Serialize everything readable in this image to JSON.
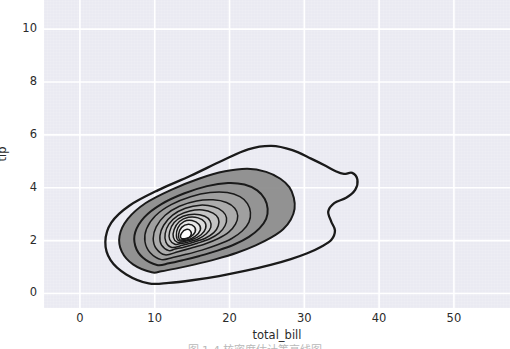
{
  "chart_data": {
    "type": "line",
    "subtype": "kde-contour",
    "title": "",
    "subtitle": "",
    "xlabel": "total_bill",
    "ylabel": "tip",
    "xlim": [
      -4.8,
      57.5
    ],
    "ylim": [
      -0.55,
      11.1
    ],
    "xticks": [
      0,
      10,
      20,
      30,
      40,
      50
    ],
    "yticks": [
      0,
      2,
      4,
      6,
      8,
      10
    ],
    "xtick_labels": [
      "0",
      "10",
      "20",
      "30",
      "40",
      "50"
    ],
    "ytick_labels": [
      "0",
      "2",
      "4",
      "6",
      "8",
      "10"
    ],
    "grid": true,
    "grid_color": "#ffffff",
    "plot_background": "#eaeaf2",
    "legend": null,
    "legend_position": "none",
    "line_color": "#1a1a1a",
    "fill_colormap": "gray-reversed",
    "n_levels": 12,
    "peak": {
      "total_bill": 13.5,
      "tip": 2.0
    },
    "contours": [
      {
        "level": 1,
        "level_label": "outermost",
        "points": [
          [
            9.2,
            0.38
          ],
          [
            6.2,
            0.72
          ],
          [
            4.1,
            1.26
          ],
          [
            3.4,
            1.95
          ],
          [
            4.2,
            2.68
          ],
          [
            6.6,
            3.32
          ],
          [
            10.4,
            3.9
          ],
          [
            14.8,
            4.45
          ],
          [
            19.0,
            5.02
          ],
          [
            22.5,
            5.45
          ],
          [
            25.6,
            5.58
          ],
          [
            28.4,
            5.42
          ],
          [
            30.9,
            5.1
          ],
          [
            32.9,
            4.82
          ],
          [
            34.2,
            4.62
          ],
          [
            35.3,
            4.52
          ],
          [
            36.4,
            4.56
          ],
          [
            37.1,
            4.3
          ],
          [
            36.8,
            3.92
          ],
          [
            35.6,
            3.62
          ],
          [
            34.0,
            3.42
          ],
          [
            33.2,
            3.1
          ],
          [
            33.6,
            2.72
          ],
          [
            34.1,
            2.38
          ],
          [
            33.6,
            2.02
          ],
          [
            32.2,
            1.76
          ],
          [
            30.4,
            1.52
          ],
          [
            28.2,
            1.3
          ],
          [
            25.5,
            1.08
          ],
          [
            22.2,
            0.86
          ],
          [
            18.6,
            0.66
          ],
          [
            15.0,
            0.5
          ],
          [
            11.9,
            0.4
          ],
          [
            9.2,
            0.38
          ]
        ]
      },
      {
        "level": 2,
        "points": [
          [
            9.6,
            0.8
          ],
          [
            7.1,
            1.1
          ],
          [
            5.6,
            1.58
          ],
          [
            5.3,
            2.18
          ],
          [
            6.4,
            2.82
          ],
          [
            8.8,
            3.42
          ],
          [
            12.2,
            3.92
          ],
          [
            15.9,
            4.34
          ],
          [
            19.4,
            4.62
          ],
          [
            22.4,
            4.72
          ],
          [
            24.9,
            4.6
          ],
          [
            26.8,
            4.34
          ],
          [
            28.0,
            4.02
          ],
          [
            28.6,
            3.62
          ],
          [
            28.7,
            3.2
          ],
          [
            28.2,
            2.8
          ],
          [
            27.2,
            2.44
          ],
          [
            25.6,
            2.12
          ],
          [
            23.5,
            1.82
          ],
          [
            21.0,
            1.54
          ],
          [
            18.2,
            1.3
          ],
          [
            15.4,
            1.1
          ],
          [
            12.8,
            0.94
          ],
          [
            10.9,
            0.84
          ],
          [
            9.6,
            0.8
          ]
        ]
      },
      {
        "level": 3,
        "points": [
          [
            10.3,
            1.08
          ],
          [
            8.4,
            1.36
          ],
          [
            7.4,
            1.8
          ],
          [
            7.4,
            2.32
          ],
          [
            8.6,
            2.88
          ],
          [
            10.9,
            3.38
          ],
          [
            13.9,
            3.78
          ],
          [
            17.0,
            4.06
          ],
          [
            19.8,
            4.18
          ],
          [
            22.0,
            4.12
          ],
          [
            23.7,
            3.9
          ],
          [
            24.7,
            3.58
          ],
          [
            25.1,
            3.2
          ],
          [
            24.9,
            2.82
          ],
          [
            24.0,
            2.46
          ],
          [
            22.6,
            2.14
          ],
          [
            20.7,
            1.86
          ],
          [
            18.4,
            1.62
          ],
          [
            16.0,
            1.42
          ],
          [
            13.8,
            1.26
          ],
          [
            11.9,
            1.14
          ],
          [
            10.3,
            1.08
          ]
        ]
      },
      {
        "level": 4,
        "points": [
          [
            10.9,
            1.28
          ],
          [
            9.4,
            1.54
          ],
          [
            8.7,
            1.96
          ],
          [
            8.9,
            2.44
          ],
          [
            10.1,
            2.94
          ],
          [
            12.2,
            3.36
          ],
          [
            14.8,
            3.66
          ],
          [
            17.4,
            3.82
          ],
          [
            19.7,
            3.82
          ],
          [
            21.4,
            3.66
          ],
          [
            22.4,
            3.4
          ],
          [
            22.8,
            3.06
          ],
          [
            22.6,
            2.7
          ],
          [
            21.7,
            2.36
          ],
          [
            20.3,
            2.08
          ],
          [
            18.4,
            1.84
          ],
          [
            16.3,
            1.64
          ],
          [
            14.2,
            1.48
          ],
          [
            12.4,
            1.36
          ],
          [
            10.9,
            1.28
          ]
        ]
      },
      {
        "level": 5,
        "points": [
          [
            11.4,
            1.46
          ],
          [
            10.2,
            1.7
          ],
          [
            9.8,
            2.08
          ],
          [
            10.2,
            2.52
          ],
          [
            11.4,
            2.96
          ],
          [
            13.3,
            3.3
          ],
          [
            15.6,
            3.5
          ],
          [
            17.8,
            3.54
          ],
          [
            19.6,
            3.44
          ],
          [
            20.7,
            3.22
          ],
          [
            21.1,
            2.94
          ],
          [
            20.8,
            2.62
          ],
          [
            19.9,
            2.32
          ],
          [
            18.5,
            2.08
          ],
          [
            16.8,
            1.88
          ],
          [
            14.9,
            1.72
          ],
          [
            13.1,
            1.58
          ],
          [
            11.4,
            1.46
          ]
        ]
      },
      {
        "level": 6,
        "points": [
          [
            11.9,
            1.62
          ],
          [
            10.9,
            1.84
          ],
          [
            10.7,
            2.18
          ],
          [
            11.2,
            2.58
          ],
          [
            12.4,
            2.96
          ],
          [
            14.1,
            3.22
          ],
          [
            16.1,
            3.34
          ],
          [
            17.9,
            3.28
          ],
          [
            19.1,
            3.1
          ],
          [
            19.6,
            2.86
          ],
          [
            19.4,
            2.56
          ],
          [
            18.6,
            2.28
          ],
          [
            17.3,
            2.06
          ],
          [
            15.7,
            1.9
          ],
          [
            14.0,
            1.76
          ],
          [
            12.7,
            1.68
          ],
          [
            11.9,
            1.62
          ]
        ]
      },
      {
        "level": 7,
        "points": [
          [
            12.3,
            1.74
          ],
          [
            11.5,
            1.94
          ],
          [
            11.4,
            2.26
          ],
          [
            11.9,
            2.62
          ],
          [
            13.1,
            2.94
          ],
          [
            14.7,
            3.12
          ],
          [
            16.4,
            3.16
          ],
          [
            17.8,
            3.04
          ],
          [
            18.5,
            2.84
          ],
          [
            18.5,
            2.56
          ],
          [
            17.9,
            2.3
          ],
          [
            16.7,
            2.08
          ],
          [
            15.2,
            1.94
          ],
          [
            13.7,
            1.82
          ],
          [
            12.3,
            1.74
          ]
        ]
      },
      {
        "level": 8,
        "points": [
          [
            12.7,
            1.86
          ],
          [
            12.0,
            2.04
          ],
          [
            12.0,
            2.34
          ],
          [
            12.6,
            2.68
          ],
          [
            13.8,
            2.92
          ],
          [
            15.3,
            3.0
          ],
          [
            16.7,
            2.92
          ],
          [
            17.4,
            2.74
          ],
          [
            17.5,
            2.5
          ],
          [
            16.9,
            2.26
          ],
          [
            15.8,
            2.06
          ],
          [
            14.4,
            1.94
          ],
          [
            13.3,
            1.88
          ],
          [
            12.7,
            1.86
          ]
        ]
      },
      {
        "level": 9,
        "points": [
          [
            13.0,
            1.94
          ],
          [
            12.5,
            2.12
          ],
          [
            12.6,
            2.42
          ],
          [
            13.3,
            2.72
          ],
          [
            14.5,
            2.88
          ],
          [
            15.8,
            2.86
          ],
          [
            16.7,
            2.7
          ],
          [
            16.8,
            2.46
          ],
          [
            16.2,
            2.22
          ],
          [
            15.0,
            2.04
          ],
          [
            13.8,
            1.96
          ],
          [
            13.0,
            1.94
          ]
        ]
      },
      {
        "level": 10,
        "points": [
          [
            13.2,
            2.0
          ],
          [
            12.9,
            2.18
          ],
          [
            13.1,
            2.48
          ],
          [
            13.9,
            2.72
          ],
          [
            15.0,
            2.76
          ],
          [
            15.9,
            2.62
          ],
          [
            16.1,
            2.4
          ],
          [
            15.4,
            2.16
          ],
          [
            14.3,
            2.02
          ],
          [
            13.2,
            2.0
          ]
        ]
      },
      {
        "level": 11,
        "points": [
          [
            13.3,
            2.04
          ],
          [
            13.2,
            2.24
          ],
          [
            13.6,
            2.5
          ],
          [
            14.5,
            2.62
          ],
          [
            15.3,
            2.52
          ],
          [
            15.4,
            2.32
          ],
          [
            14.7,
            2.12
          ],
          [
            13.8,
            2.04
          ],
          [
            13.3,
            2.04
          ]
        ]
      },
      {
        "level": 12,
        "level_label": "innermost peak",
        "points": [
          [
            13.5,
            2.1
          ],
          [
            13.6,
            2.28
          ],
          [
            14.2,
            2.42
          ],
          [
            14.8,
            2.36
          ],
          [
            14.8,
            2.18
          ],
          [
            14.2,
            2.08
          ],
          [
            13.5,
            2.1
          ]
        ]
      }
    ]
  },
  "axes": {
    "xlabel": "total_bill",
    "ylabel": "tip",
    "xtick_labels": [
      "0",
      "10",
      "20",
      "30",
      "40",
      "50"
    ],
    "ytick_labels": [
      "0",
      "2",
      "4",
      "6",
      "8",
      "10"
    ]
  },
  "caption": {
    "cropped_text": "图 1-4 核密度估计等高线图"
  }
}
